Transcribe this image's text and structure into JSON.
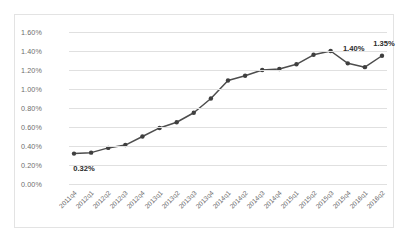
{
  "chart_data": {
    "type": "line",
    "title": "",
    "xlabel": "",
    "ylabel": "",
    "grid": true,
    "legend": "none",
    "ylim": [
      0.0,
      1.6
    ],
    "ytick_step": 0.2,
    "ytick_labels": [
      "1.60%",
      "1.40%",
      "1.20%",
      "1.00%",
      "0.80%",
      "0.60%",
      "0.40%",
      "0.20%",
      "0.00%"
    ],
    "ytick_values": [
      1.6,
      1.4,
      1.2,
      1.0,
      0.8,
      0.6,
      0.4,
      0.2,
      0.0
    ],
    "categories": [
      "2011q4",
      "2012q1",
      "2012q2",
      "2012q3",
      "2012q4",
      "2013q1",
      "2013q2",
      "2013q3",
      "2013q4",
      "2014q1",
      "2014q2",
      "2014q3",
      "2014q4",
      "2015q1",
      "2015q2",
      "2015q3",
      "2015q4",
      "2016q1",
      "2016q2"
    ],
    "values": [
      0.32,
      0.33,
      0.38,
      0.41,
      0.5,
      0.59,
      0.65,
      0.75,
      0.9,
      1.09,
      1.14,
      1.2,
      1.21,
      1.26,
      1.36,
      1.4,
      1.27,
      1.23,
      1.35
    ],
    "series_color": "#4d4d4d",
    "marker_color": "#3f3f3f",
    "grid_color": "#e0e0e0",
    "point_annotations": [
      {
        "index": 0,
        "text": "0.32%",
        "position": "below"
      },
      {
        "index": 15,
        "text": "1.40%",
        "position": "right"
      },
      {
        "index": 18,
        "text": "1.35%",
        "position": "above"
      }
    ]
  }
}
